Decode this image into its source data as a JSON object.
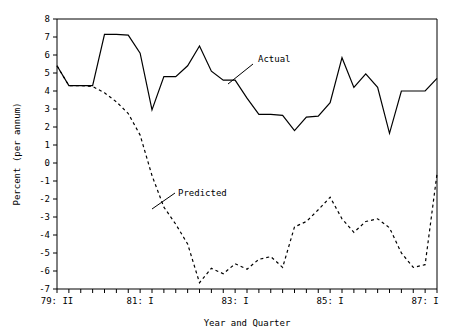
{
  "chart_data": {
    "type": "line",
    "title": "",
    "xlabel": "Year and Quarter",
    "ylabel": "Percent (per annum)",
    "ylim": [
      -7,
      8
    ],
    "yticks": [
      8,
      7,
      6,
      5,
      4,
      3,
      2,
      1,
      0,
      -1,
      -2,
      -3,
      -4,
      -5,
      -6,
      -7
    ],
    "ytick_labels": [
      "8",
      "7",
      "6",
      "5",
      "4",
      "3",
      "2",
      "1",
      "0",
      "-1",
      "-2",
      "-3",
      "-4",
      "-5",
      "-6",
      "-7"
    ],
    "grid": false,
    "legend_position": "inline-annotation",
    "x_index_range": [
      0,
      32
    ],
    "xtick_labeled": [
      {
        "index": 0,
        "label": "79: II"
      },
      {
        "index": 7,
        "label": "81: I"
      },
      {
        "index": 15,
        "label": "83: I"
      },
      {
        "index": 23,
        "label": "85: I"
      },
      {
        "index": 31,
        "label": "87: I"
      }
    ],
    "xtick_count": 33,
    "x": [
      "79:II",
      "79:III",
      "79:IV",
      "80:I",
      "80:II",
      "80:III",
      "80:IV",
      "81:I",
      "81:II",
      "81:III",
      "81:IV",
      "82:I",
      "82:II",
      "82:III",
      "82:IV",
      "83:I",
      "83:II",
      "83:III",
      "83:IV",
      "84:I",
      "84:II",
      "84:III",
      "84:IV",
      "85:I",
      "85:II",
      "85:III",
      "85:IV",
      "86:I",
      "86:II",
      "86:III",
      "86:IV",
      "87:I",
      "87:II"
    ],
    "series": [
      {
        "name": "Actual",
        "style": "solid",
        "values": [
          5.4,
          4.3,
          4.3,
          4.3,
          7.15,
          7.15,
          7.1,
          6.1,
          2.95,
          4.8,
          4.8,
          5.4,
          6.5,
          5.1,
          4.6,
          4.6,
          3.6,
          2.7,
          2.7,
          2.65,
          1.8,
          2.55,
          2.6,
          3.35,
          5.85,
          4.2,
          4.95,
          4.2,
          1.65,
          4.0,
          4.0,
          4.0,
          4.7
        ]
      },
      {
        "name": "Predicted",
        "style": "dashed",
        "values": [
          5.4,
          4.3,
          4.3,
          4.25,
          3.9,
          3.4,
          2.75,
          1.55,
          -0.7,
          -2.45,
          -3.4,
          -4.5,
          -6.65,
          -5.85,
          -6.15,
          -5.6,
          -5.9,
          -5.35,
          -5.2,
          -5.8,
          -3.55,
          -3.25,
          -2.6,
          -1.9,
          -3.1,
          -3.85,
          -3.25,
          -3.1,
          -3.6,
          -5.0,
          -5.8,
          -5.65,
          -0.6
        ]
      }
    ],
    "annotations": [
      {
        "text": "Actual",
        "text_x": 258,
        "text_y": 62,
        "leader_from_x": 253,
        "leader_from_y": 64,
        "leader_to_x": 228,
        "leader_to_y": 84
      },
      {
        "text": "Predicted",
        "text_x": 178,
        "text_y": 196,
        "leader_from_x": 175,
        "leader_from_y": 193,
        "leader_to_x": 152,
        "leader_to_y": 209
      }
    ]
  },
  "plot_geometry": {
    "left": 57,
    "right": 437,
    "top": 19,
    "bottom": 289
  }
}
